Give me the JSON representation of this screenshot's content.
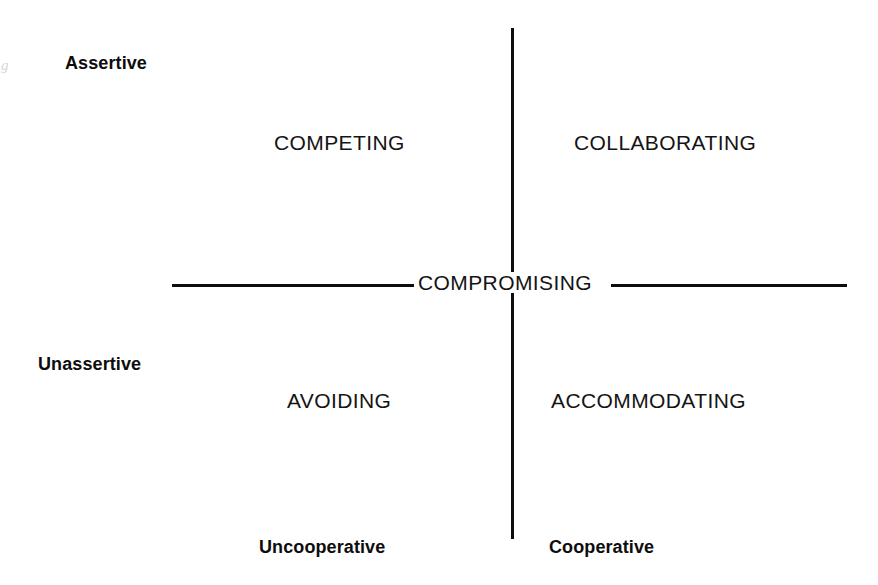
{
  "figure": {
    "background_color": "#ffffff",
    "line_color": "#0d0d0d",
    "text_color": "#141414"
  },
  "axes": {
    "vertical": {
      "name": "assertiveness-axis",
      "top_label": "Assertive",
      "bottom_label": "Unassertive"
    },
    "horizontal": {
      "name": "cooperativeness-axis",
      "left_label": "Uncooperative",
      "right_label": "Cooperative"
    }
  },
  "dimension_labels": {
    "assertive": "Assertive",
    "unassertive": "Unassertive",
    "uncooperative": "Uncooperative",
    "cooperative": "Cooperative"
  },
  "modes": {
    "top_left": "COMPETING",
    "top_right": "COLLABORATING",
    "center": "COMPROMISING",
    "bottom_left": "AVOIDING",
    "bottom_right": "ACCOMMODATING"
  },
  "artifact": {
    "mark": "g"
  },
  "chart_data": {
    "type": "scatter",
    "title": "",
    "xlabel": "",
    "ylabel": "",
    "xlim": [
      0,
      1
    ],
    "ylim": [
      0,
      1
    ],
    "grid": false,
    "legend": false,
    "axis_labels": {
      "x_low": "Uncooperative",
      "x_high": "Cooperative",
      "y_low": "Unassertive",
      "y_high": "Assertive"
    },
    "annotations": [
      {
        "label": "COMPETING",
        "x": 0.22,
        "y": 0.88,
        "quadrant": "assertive-uncooperative"
      },
      {
        "label": "COLLABORATING",
        "x": 0.8,
        "y": 0.88,
        "quadrant": "assertive-cooperative"
      },
      {
        "label": "COMPROMISING",
        "x": 0.5,
        "y": 0.5,
        "quadrant": "center"
      },
      {
        "label": "AVOIDING",
        "x": 0.22,
        "y": 0.12,
        "quadrant": "unassertive-uncooperative"
      },
      {
        "label": "ACCOMMODATING",
        "x": 0.8,
        "y": 0.12,
        "quadrant": "unassertive-cooperative"
      }
    ]
  }
}
